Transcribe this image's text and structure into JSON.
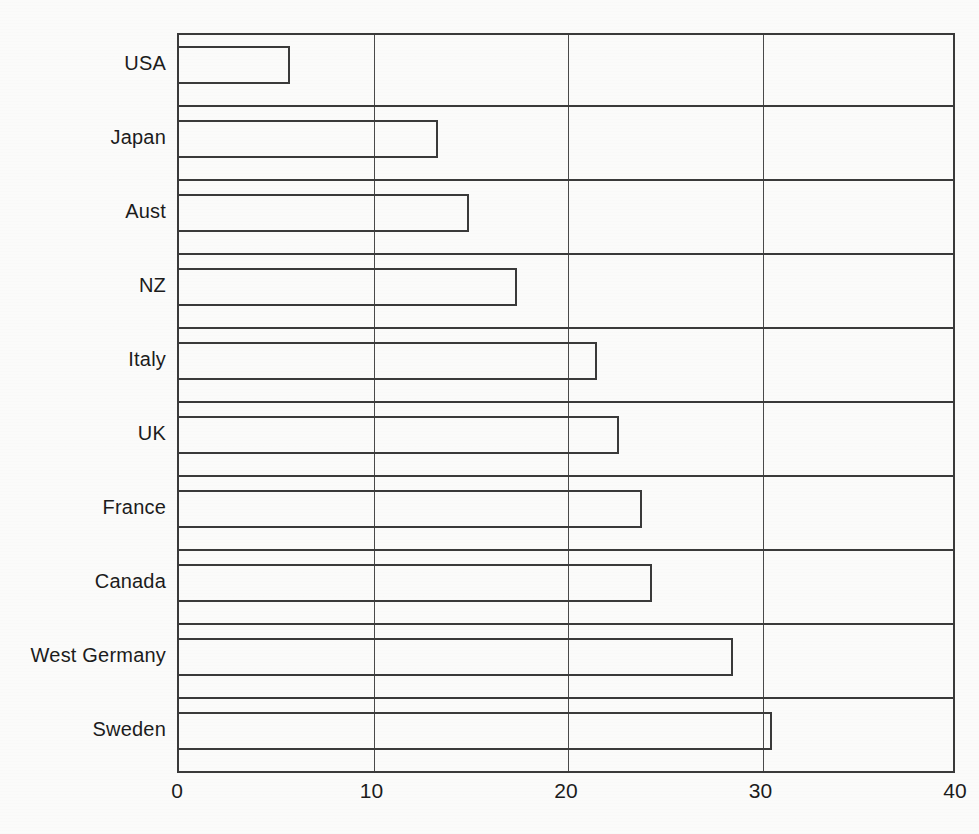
{
  "chart_data": {
    "type": "bar",
    "orientation": "horizontal",
    "title": "",
    "subtitle": "",
    "xlabel": "",
    "ylabel": "",
    "categories": [
      "USA",
      "Japan",
      "Aust",
      "NZ",
      "Italy",
      "UK",
      "France",
      "Canada",
      "West Germany",
      "Sweden"
    ],
    "values": [
      5.8,
      13.4,
      15.0,
      17.5,
      21.6,
      22.7,
      23.9,
      24.4,
      28.6,
      30.6
    ],
    "series": [
      {
        "name": "",
        "values": [
          5.8,
          13.4,
          15.0,
          17.5,
          21.6,
          22.7,
          23.9,
          24.4,
          28.6,
          30.6
        ]
      }
    ],
    "xlim": [
      0,
      40
    ],
    "xticks": [
      0,
      10,
      20,
      30,
      40
    ],
    "xtick_labels": [
      "0",
      "10",
      "20",
      "30",
      "40"
    ],
    "grid": "vertical",
    "gridline_values": [
      10,
      20,
      30
    ],
    "legend": null,
    "legend_position": "none",
    "bar_style": "outlined",
    "bar_fill_color": "#ffffff",
    "bar_edge_color": "#3a3a3a",
    "background_color": "#fbfbfa",
    "axis_color": "#3a3a3a",
    "annotations": []
  }
}
